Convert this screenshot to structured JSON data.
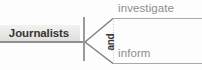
{
  "diagram": {
    "type": "fork-branching-diagram",
    "subject": {
      "label": "Journalists"
    },
    "conjunction": {
      "label": "and",
      "orientation": "vertical"
    },
    "branches": [
      {
        "label": "investigate",
        "position": "top"
      },
      {
        "label": "inform",
        "position": "bottom"
      }
    ],
    "colors": {
      "background": "#fdfdfd",
      "subject_text": "#353535",
      "subject_box_fill": "#e9e9e7",
      "branch_text": "#8d8d8d",
      "rule": "#a9a9a9",
      "fork_line": "#7d7d7d",
      "bar": "#9b9b9b",
      "dotted_connector": "#c9c9c9"
    }
  }
}
